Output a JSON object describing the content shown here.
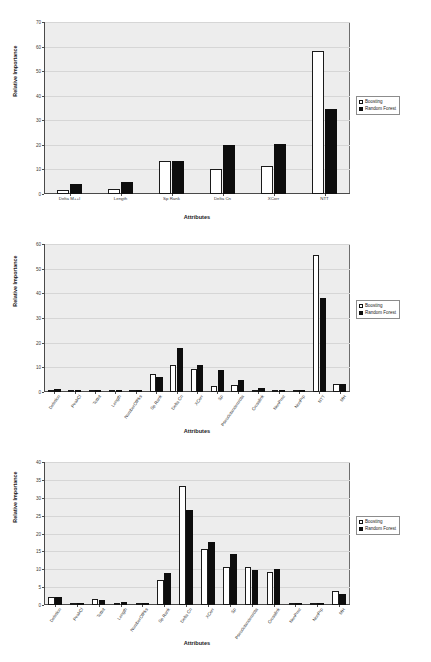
{
  "page": {
    "number": ""
  },
  "legend": {
    "boosting_label": "Boosting",
    "random_forest_label": "Random Forest"
  },
  "axis_titles": {
    "y": "Relative Importance",
    "x": "Attributes"
  },
  "chart_data": [
    {
      "type": "bar",
      "id": "figure-1",
      "title": "",
      "xlabel": "Attributes",
      "ylabel": "Relative Importance",
      "ylim": [
        0,
        70
      ],
      "yticks": [
        0,
        10,
        20,
        30,
        40,
        50,
        60,
        70
      ],
      "grid": true,
      "legend_position": "right",
      "categories": [
        "Delta M++I",
        "Length",
        "Sp Rank",
        "Delta Cn",
        "XCorr",
        "NTT"
      ],
      "series": [
        {
          "name": "Boosting",
          "values": [
            1.6,
            2.2,
            13.6,
            10.1,
            11.2,
            58.2
          ]
        },
        {
          "name": "Random Forest",
          "values": [
            4.0,
            4.7,
            13.5,
            19.8,
            20.3,
            34.5
          ]
        }
      ]
    },
    {
      "type": "bar",
      "id": "figure-2",
      "title": "",
      "xlabel": "Attributes",
      "ylabel": "Relative Importance",
      "ylim": [
        0,
        60
      ],
      "yticks": [
        0,
        10,
        20,
        30,
        40,
        50,
        60
      ],
      "grid": true,
      "legend_position": "right",
      "categories": [
        "Deletion",
        "PeakCl",
        "TotInt",
        "Length",
        "NumberOfPks",
        "Sp Rank",
        "Delta Cn",
        "XCorr",
        "Sp",
        "Pseudotandem/dta",
        "Crosslink",
        "NonPrec",
        "NonPrp",
        "NTT",
        "MH"
      ],
      "series": [
        {
          "name": "Boosting",
          "values": [
            1.0,
            0.2,
            0.7,
            0.2,
            0.3,
            7.2,
            11.1,
            9.3,
            2.6,
            2.9,
            0.2,
            0.3,
            0.1,
            55.5,
            3.1
          ]
        },
        {
          "name": "Random Forest",
          "values": [
            1.2,
            0.3,
            0.7,
            0.4,
            0.4,
            6.0,
            18.0,
            11.0,
            9.1,
            4.8,
            1.6,
            0.1,
            0.1,
            38.2,
            3.1
          ]
        }
      ]
    },
    {
      "type": "bar",
      "id": "figure-3",
      "title": "",
      "xlabel": "Attributes",
      "ylabel": "Relative Importance",
      "ylim": [
        0,
        40
      ],
      "yticks": [
        0,
        5,
        10,
        15,
        20,
        25,
        30,
        35,
        40
      ],
      "grid": true,
      "legend_position": "right",
      "categories": [
        "Deletion",
        "PeakCl",
        "TotInt",
        "Length",
        "NumberOfPks",
        "Sp Rank",
        "Delta Cn",
        "XCorr",
        "Sp",
        "Pseudotandem/dta",
        "Crosslink",
        "NonPrec",
        "NonPrp",
        "MH"
      ],
      "series": [
        {
          "name": "Boosting",
          "values": [
            2.3,
            0.2,
            1.6,
            0.4,
            0.5,
            6.9,
            33.3,
            15.8,
            10.5,
            10.6,
            9.3,
            0.2,
            0.2,
            4.0
          ]
        },
        {
          "name": "Random Forest",
          "values": [
            2.2,
            0.3,
            1.5,
            0.8,
            0.7,
            9.0,
            26.7,
            17.7,
            14.2,
            9.9,
            10.2,
            0.1,
            0.1,
            3.1
          ]
        }
      ]
    }
  ]
}
